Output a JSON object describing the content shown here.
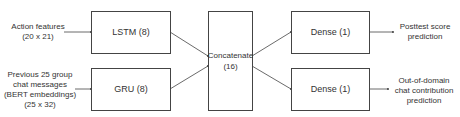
{
  "inputs": {
    "action": {
      "line1": "Action features",
      "line2": "(20 x 21)"
    },
    "chat": {
      "line1": "Previous 25 group",
      "line2": "chat messages",
      "line3": "(BERT embeddings)",
      "line4": "(25 x 32)"
    }
  },
  "layers": {
    "lstm": "LSTM (8)",
    "gru": "GRU (8)",
    "concat_line1": "Concatenate",
    "concat_line2": "(16)",
    "dense_top": "Dense (1)",
    "dense_bottom": "Dense (1)"
  },
  "outputs": {
    "posttest": {
      "line1": "Posttest score",
      "line2": "prediction"
    },
    "ood": {
      "line1": "Out-of-domain",
      "line2": "chat contribution",
      "line3": "prediction"
    }
  },
  "colors": {
    "stroke": "#444444",
    "text": "#333333",
    "background": "#ffffff"
  }
}
